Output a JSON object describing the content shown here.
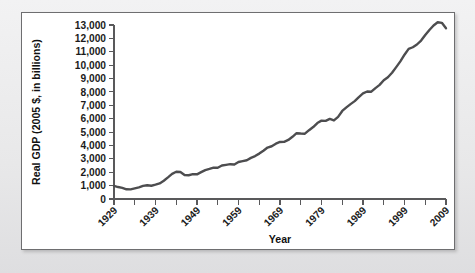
{
  "figure": {
    "panel_background": "#ffffff",
    "page_background": "#ececed",
    "border_color": "#6e6e70"
  },
  "chart_data": {
    "type": "line",
    "title": "",
    "xlabel": "Year",
    "ylabel": "Real GDP (2005 $, in billions)",
    "line_color": "#4d4d4f",
    "grid": false,
    "legend": "none",
    "xlim": [
      1929,
      2009
    ],
    "ylim": [
      0,
      13000
    ],
    "ytick_labels": [
      "13,000",
      "12,000",
      "11,000",
      "10,000",
      "9,000",
      "8,000",
      "7,000",
      "6,000",
      "5,000",
      "4,000",
      "3,000",
      "2,000",
      "1,000",
      "0"
    ],
    "ytick_values": [
      13000,
      12000,
      11000,
      10000,
      9000,
      8000,
      7000,
      6000,
      5000,
      4000,
      3000,
      2000,
      1000,
      0
    ],
    "xtick_labels": [
      "1929",
      "1939",
      "1949",
      "1959",
      "1969",
      "1979",
      "1989",
      "1999",
      "2009"
    ],
    "xtick_values": [
      1929,
      1939,
      1949,
      1959,
      1969,
      1979,
      1989,
      1999,
      2009
    ],
    "xminor_values": [
      1934,
      1944,
      1954,
      1964,
      1974,
      1984,
      1994,
      2004
    ],
    "x": [
      1929,
      1930,
      1931,
      1932,
      1933,
      1934,
      1935,
      1936,
      1937,
      1938,
      1939,
      1940,
      1941,
      1942,
      1943,
      1944,
      1945,
      1946,
      1947,
      1948,
      1949,
      1950,
      1951,
      1952,
      1953,
      1954,
      1955,
      1956,
      1957,
      1958,
      1959,
      1960,
      1961,
      1962,
      1963,
      1964,
      1965,
      1966,
      1967,
      1968,
      1969,
      1970,
      1971,
      1972,
      1973,
      1974,
      1975,
      1976,
      1977,
      1978,
      1979,
      1980,
      1981,
      1982,
      1983,
      1984,
      1985,
      1986,
      1987,
      1988,
      1989,
      1990,
      1991,
      1992,
      1993,
      1994,
      1995,
      1996,
      1997,
      1998,
      1999,
      2000,
      2001,
      2002,
      2003,
      2004,
      2005,
      2006,
      2007,
      2008,
      2009
    ],
    "values": [
      977,
      893,
      835,
      726,
      716,
      794,
      865,
      977,
      1028,
      992,
      1072,
      1166,
      1366,
      1618,
      1883,
      2035,
      2012,
      1792,
      1776,
      1854,
      1844,
      2006,
      2161,
      2244,
      2347,
      2332,
      2500,
      2550,
      2601,
      2577,
      2762,
      2830,
      2897,
      3074,
      3206,
      3392,
      3610,
      3845,
      3942,
      4133,
      4262,
      4270,
      4413,
      4648,
      4917,
      4890,
      4880,
      5141,
      5378,
      5677,
      5855,
      5839,
      5987,
      5871,
      6136,
      6577,
      6849,
      7087,
      7313,
      7614,
      7886,
      8034,
      8015,
      8287,
      8523,
      8871,
      9094,
      9434,
      9854,
      10284,
      10780,
      11216,
      11338,
      11543,
      11836,
      12247,
      12623,
      12959,
      13206,
      13162,
      12758
    ]
  }
}
